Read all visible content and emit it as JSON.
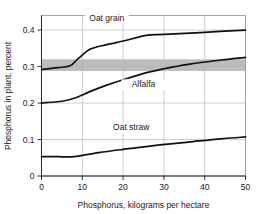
{
  "chart_data": {
    "type": "line",
    "title": "",
    "xlabel": "Phosphorus, kilograms per hectare",
    "ylabel": "Phosphorus in plant, percent",
    "xlim": [
      0,
      50
    ],
    "ylim": [
      0,
      0.44
    ],
    "xticks": [
      0,
      10,
      20,
      30,
      40,
      50
    ],
    "yticks": [
      0,
      0.1,
      0.2,
      0.3,
      0.4
    ],
    "xtick_labels": [
      "0",
      "10",
      "20",
      "30",
      "40",
      "50"
    ],
    "ytick_labels": [
      "0",
      "0.1",
      "0.2",
      "0.3",
      "0.4"
    ],
    "grid": true,
    "legend": "inline-labels",
    "annotations": [
      {
        "name": "shaded-band",
        "label": "",
        "y_range": [
          0.288,
          0.32
        ],
        "color": "#b3b3b3",
        "description": "gray horizontal band spanning full plot width"
      }
    ],
    "series": [
      {
        "name": "Oat grain",
        "label": "Oat grain",
        "color": "#111111",
        "x": [
          0,
          4,
          7,
          9,
          12,
          16,
          20,
          26,
          30,
          40,
          50
        ],
        "y": [
          0.292,
          0.297,
          0.302,
          0.322,
          0.348,
          0.36,
          0.37,
          0.386,
          0.388,
          0.394,
          0.4
        ],
        "label_x": 16,
        "label_y": 0.425
      },
      {
        "name": "Alfalfa",
        "label": "Alfalfa",
        "color": "#111111",
        "x": [
          0,
          5,
          8,
          12,
          16,
          20,
          26,
          30,
          36,
          44,
          50
        ],
        "y": [
          0.2,
          0.205,
          0.213,
          0.232,
          0.249,
          0.264,
          0.284,
          0.294,
          0.306,
          0.318,
          0.325
        ],
        "label_x": 25,
        "label_y": 0.243
      },
      {
        "name": "Oat straw",
        "label": "Oat straw",
        "color": "#111111",
        "x": [
          0,
          4,
          8,
          14,
          20,
          28,
          36,
          44,
          50
        ],
        "y": [
          0.053,
          0.053,
          0.053,
          0.064,
          0.073,
          0.084,
          0.093,
          0.102,
          0.107
        ],
        "label_x": 22,
        "label_y": 0.125
      }
    ]
  }
}
